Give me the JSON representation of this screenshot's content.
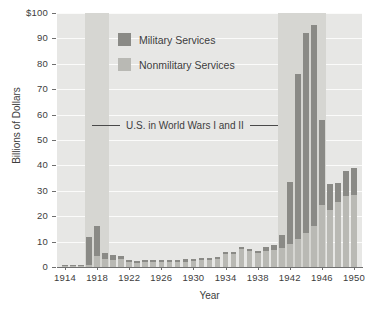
{
  "chart_data": {
    "type": "bar",
    "stacked": true,
    "title": "",
    "xlabel": "Year",
    "ylabel": "Billions of Dollars",
    "ylim": [
      0,
      100
    ],
    "ytick_labels": [
      "0",
      "10",
      "20",
      "30",
      "40",
      "50",
      "60",
      "70",
      "80",
      "90",
      "$100"
    ],
    "ytick_values": [
      0,
      10,
      20,
      30,
      40,
      50,
      60,
      70,
      80,
      90,
      100
    ],
    "xtick_labels": [
      "1914",
      "1918",
      "1922",
      "1926",
      "1930",
      "1934",
      "1938",
      "1942",
      "1946",
      "1950"
    ],
    "xtick_values": [
      1914,
      1918,
      1922,
      1926,
      1930,
      1934,
      1938,
      1942,
      1946,
      1950
    ],
    "xlim": [
      1913,
      1951
    ],
    "grid": true,
    "legend_position": "upper-left-inside",
    "categories": [
      1914,
      1915,
      1916,
      1917,
      1918,
      1919,
      1920,
      1921,
      1922,
      1923,
      1924,
      1925,
      1926,
      1927,
      1928,
      1929,
      1930,
      1931,
      1932,
      1933,
      1934,
      1935,
      1936,
      1937,
      1938,
      1939,
      1940,
      1941,
      1942,
      1943,
      1944,
      1945,
      1946,
      1947,
      1948,
      1949,
      1950
    ],
    "series": [
      {
        "name": "Nonmilitary Services",
        "color": "#b9b9b4",
        "values": [
          0.5,
          0.4,
          0.4,
          0.8,
          4.2,
          3.3,
          2.9,
          3.2,
          1.8,
          1.7,
          1.8,
          1.8,
          1.8,
          1.9,
          2.0,
          2.1,
          2.3,
          2.6,
          2.8,
          3.2,
          5.0,
          5.0,
          7.0,
          6.3,
          5.4,
          6.4,
          6.9,
          7.5,
          9.0,
          11.0,
          13.5,
          16.0,
          24.5,
          22.5,
          25.5,
          28.0,
          28.5
        ]
      },
      {
        "name": "Military Services",
        "color": "#8a8a86",
        "values": [
          0.3,
          0.3,
          0.3,
          11.0,
          12.0,
          2.4,
          1.7,
          1.0,
          0.9,
          0.8,
          0.8,
          0.8,
          0.8,
          0.8,
          0.9,
          0.9,
          0.9,
          0.9,
          0.9,
          0.8,
          0.9,
          1.0,
          1.0,
          1.0,
          1.1,
          1.3,
          1.8,
          5.0,
          24.5,
          65.0,
          78.5,
          79.5,
          33.5,
          10.0,
          7.5,
          10.0,
          10.5
        ]
      }
    ],
    "totals": [
      0.8,
      0.7,
      0.7,
      11.8,
      16.2,
      5.7,
      4.6,
      4.2,
      2.7,
      2.5,
      2.6,
      2.6,
      2.6,
      2.7,
      2.9,
      3.0,
      3.2,
      3.5,
      3.7,
      4.0,
      5.9,
      6.0,
      8.0,
      7.3,
      6.5,
      7.7,
      8.7,
      12.5,
      33.5,
      76.0,
      92.0,
      95.5,
      58.0,
      32.5,
      33.0,
      38.0,
      39.0
    ],
    "annotations": [
      {
        "text": "U.S. in World Wars I and II",
        "type": "span-label",
        "has_left_rule": true,
        "has_right_rule": true
      }
    ],
    "shaded_bands": [
      {
        "label": "World War I",
        "start": 1917,
        "end": 1919
      },
      {
        "label": "World War II",
        "start": 1941,
        "end": 1946
      }
    ],
    "colors": {
      "military": "#8a8a86",
      "nonmilitary": "#b9b9b4",
      "plot_background": "#e7e7e5",
      "band_shade": "#d6d6d2",
      "gridline": "#fbfbfa",
      "axis": "#6f6f6f",
      "text": "#3d3d3d"
    }
  },
  "legend": {
    "items": [
      {
        "label": "Military Services",
        "swatch": "mil"
      },
      {
        "label": "Nonmilitary Services",
        "swatch": "non"
      }
    ]
  },
  "axes": {
    "x_title": "Year",
    "y_title": "Billions of Dollars"
  }
}
